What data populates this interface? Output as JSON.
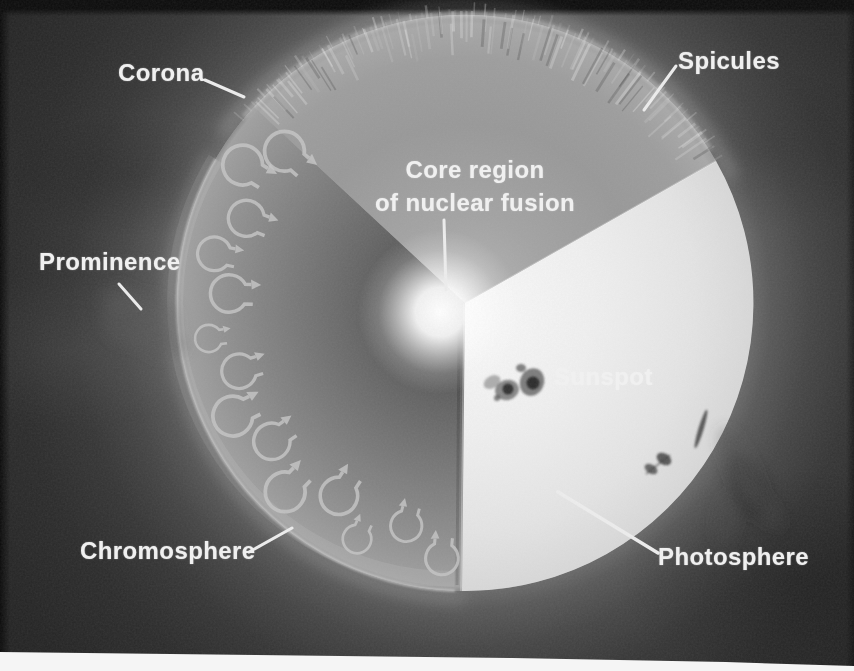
{
  "diagram": {
    "labels": {
      "corona": "Corona",
      "spicules": "Spicules",
      "core_region_line1": "Core region",
      "core_region_line2": "of nuclear fusion",
      "prominence": "Prominence",
      "sunspot": "Sunspot",
      "chromosphere": "Chromosphere",
      "photosphere": "Photosphere"
    },
    "colors": {
      "space_background": "#202020",
      "label_text": "#f0f0f0",
      "photosphere_surface": "#e6e6e6",
      "interior_upper_cutaway": "#9c9c9c",
      "interior_lower_cutaway": "#6b6b6b",
      "core_glow": "#ffffff",
      "convection_arrows": "#c6c6c6",
      "sunspot": "#2e2e2e",
      "page_edge_strip": "#f5f5f5"
    }
  }
}
